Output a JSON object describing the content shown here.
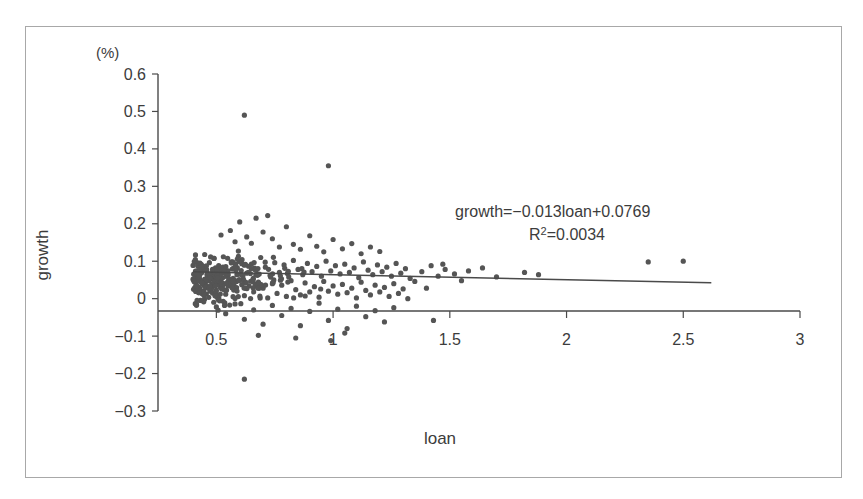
{
  "chart_data": {
    "type": "scatter",
    "title": "",
    "xlabel": "loan",
    "ylabel": "growth",
    "unit_label": "(%)",
    "xlim": [
      0.25,
      3.0
    ],
    "ylim": [
      -0.3,
      0.6
    ],
    "grid": false,
    "legend": "none",
    "x_ticks": [
      "0.5",
      "1",
      "1.5",
      "2",
      "2.5",
      "3"
    ],
    "x_tick_values": [
      0.5,
      1,
      1.5,
      2,
      2.5,
      3
    ],
    "y_ticks": [
      "0.6",
      "0.5",
      "0.4",
      "0.3",
      "0.2",
      "0.1",
      "0",
      "−0.1",
      "−0.2",
      "−0.3"
    ],
    "y_tick_values": [
      0.6,
      0.5,
      0.4,
      0.3,
      0.2,
      0.1,
      0,
      -0.1,
      -0.2,
      -0.3
    ],
    "annotations": [
      {
        "id": "regression-equation",
        "text": "growth=−0.013loan+0.0769"
      },
      {
        "id": "r-squared",
        "text_prefix": "R",
        "text_sup": "2",
        "text_suffix": "=0.0034",
        "text": "R²=0.0034"
      }
    ],
    "trendline": {
      "slope": -0.013,
      "intercept": 0.0769,
      "x_start": 0.4,
      "x_end": 2.62,
      "r_squared": 0.0034
    },
    "marker": {
      "shape": "circle",
      "radius": 2.6,
      "color": "#555555"
    },
    "n_points": 430,
    "points": [
      [
        0.62,
        0.49
      ],
      [
        0.98,
        0.355
      ],
      [
        0.6,
        0.205
      ],
      [
        0.67,
        0.215
      ],
      [
        0.72,
        0.222
      ],
      [
        0.52,
        0.17
      ],
      [
        0.56,
        0.182
      ],
      [
        0.58,
        0.152
      ],
      [
        0.63,
        0.165
      ],
      [
        0.65,
        0.148
      ],
      [
        0.7,
        0.178
      ],
      [
        0.74,
        0.16
      ],
      [
        0.77,
        0.138
      ],
      [
        0.8,
        0.192
      ],
      [
        0.83,
        0.145
      ],
      [
        0.86,
        0.132
      ],
      [
        0.9,
        0.168
      ],
      [
        0.93,
        0.14
      ],
      [
        0.96,
        0.125
      ],
      [
        1.0,
        0.158
      ],
      [
        1.04,
        0.133
      ],
      [
        1.08,
        0.147
      ],
      [
        1.12,
        0.12
      ],
      [
        1.16,
        0.138
      ],
      [
        1.2,
        0.126
      ],
      [
        0.45,
        0.118
      ],
      [
        0.47,
        0.096
      ],
      [
        0.49,
        0.108
      ],
      [
        0.51,
        0.088
      ],
      [
        0.53,
        0.112
      ],
      [
        0.55,
        0.074
      ],
      [
        0.57,
        0.098
      ],
      [
        0.59,
        0.082
      ],
      [
        0.61,
        0.104
      ],
      [
        0.63,
        0.068
      ],
      [
        0.65,
        0.092
      ],
      [
        0.67,
        0.076
      ],
      [
        0.69,
        0.11
      ],
      [
        0.71,
        0.084
      ],
      [
        0.73,
        0.062
      ],
      [
        0.75,
        0.096
      ],
      [
        0.77,
        0.07
      ],
      [
        0.79,
        0.09
      ],
      [
        0.81,
        0.058
      ],
      [
        0.83,
        0.102
      ],
      [
        0.85,
        0.078
      ],
      [
        0.87,
        0.064
      ],
      [
        0.89,
        0.094
      ],
      [
        0.91,
        0.072
      ],
      [
        0.93,
        0.086
      ],
      [
        0.95,
        0.06
      ],
      [
        0.97,
        0.1
      ],
      [
        0.99,
        0.074
      ],
      [
        1.01,
        0.088
      ],
      [
        1.03,
        0.066
      ],
      [
        1.05,
        0.092
      ],
      [
        1.07,
        0.07
      ],
      [
        1.09,
        0.082
      ],
      [
        1.11,
        0.056
      ],
      [
        1.13,
        0.098
      ],
      [
        1.15,
        0.076
      ],
      [
        1.17,
        0.064
      ],
      [
        1.19,
        0.09
      ],
      [
        1.21,
        0.072
      ],
      [
        1.23,
        0.084
      ],
      [
        1.25,
        0.06
      ],
      [
        1.27,
        0.094
      ],
      [
        1.29,
        0.068
      ],
      [
        1.31,
        0.08
      ],
      [
        1.33,
        0.054
      ],
      [
        0.44,
        0.042
      ],
      [
        0.46,
        0.03
      ],
      [
        0.48,
        0.054
      ],
      [
        0.5,
        0.022
      ],
      [
        0.52,
        0.046
      ],
      [
        0.54,
        0.012
      ],
      [
        0.56,
        0.038
      ],
      [
        0.58,
        0.026
      ],
      [
        0.6,
        0.05
      ],
      [
        0.62,
        0.008
      ],
      [
        0.64,
        0.034
      ],
      [
        0.66,
        0.018
      ],
      [
        0.68,
        0.044
      ],
      [
        0.7,
        0.028
      ],
      [
        0.72,
        0.002
      ],
      [
        0.74,
        0.04
      ],
      [
        0.76,
        0.014
      ],
      [
        0.78,
        0.036
      ],
      [
        0.8,
        0.006
      ],
      [
        0.82,
        0.048
      ],
      [
        0.84,
        0.024
      ],
      [
        0.86,
        0.01
      ],
      [
        0.88,
        0.042
      ],
      [
        0.9,
        0.018
      ],
      [
        0.92,
        0.032
      ],
      [
        0.94,
        0.004
      ],
      [
        0.96,
        0.046
      ],
      [
        0.98,
        0.02
      ],
      [
        1.0,
        0.034
      ],
      [
        1.02,
        0.012
      ],
      [
        1.04,
        0.038
      ],
      [
        1.06,
        0.016
      ],
      [
        1.08,
        0.028
      ],
      [
        1.1,
        0.002
      ],
      [
        1.12,
        0.044
      ],
      [
        1.14,
        0.022
      ],
      [
        1.16,
        0.01
      ],
      [
        1.18,
        0.036
      ],
      [
        1.2,
        0.018
      ],
      [
        1.22,
        0.03
      ],
      [
        1.24,
        0.006
      ],
      [
        1.26,
        0.04
      ],
      [
        1.28,
        0.014
      ],
      [
        1.3,
        0.026
      ],
      [
        1.32,
        0.0
      ],
      [
        0.5,
        -0.022
      ],
      [
        0.54,
        -0.04
      ],
      [
        0.58,
        -0.014
      ],
      [
        0.62,
        -0.055
      ],
      [
        0.66,
        -0.03
      ],
      [
        0.7,
        -0.068
      ],
      [
        0.74,
        -0.018
      ],
      [
        0.78,
        -0.045
      ],
      [
        0.82,
        -0.026
      ],
      [
        0.86,
        -0.072
      ],
      [
        0.9,
        -0.034
      ],
      [
        0.94,
        -0.012
      ],
      [
        0.98,
        -0.058
      ],
      [
        1.02,
        -0.028
      ],
      [
        1.06,
        -0.08
      ],
      [
        1.1,
        -0.02
      ],
      [
        1.14,
        -0.048
      ],
      [
        1.18,
        -0.032
      ],
      [
        1.22,
        -0.062
      ],
      [
        1.26,
        -0.024
      ],
      [
        0.62,
        -0.215
      ],
      [
        0.68,
        -0.098
      ],
      [
        0.84,
        -0.105
      ],
      [
        0.99,
        -0.112
      ],
      [
        1.05,
        -0.092
      ],
      [
        1.38,
        0.072
      ],
      [
        1.42,
        0.088
      ],
      [
        1.45,
        0.06
      ],
      [
        1.48,
        0.078
      ],
      [
        1.52,
        0.066
      ],
      [
        1.58,
        0.074
      ],
      [
        1.64,
        0.082
      ],
      [
        1.7,
        0.058
      ],
      [
        1.82,
        0.07
      ],
      [
        1.88,
        0.064
      ],
      [
        2.35,
        0.098
      ],
      [
        2.5,
        0.1
      ],
      [
        0.42,
        0.088
      ],
      [
        0.43,
        0.066
      ],
      [
        0.41,
        0.104
      ],
      [
        0.4,
        0.052
      ],
      [
        1.35,
        0.046
      ],
      [
        1.4,
        0.028
      ],
      [
        1.43,
        -0.058
      ],
      [
        1.47,
        0.092
      ],
      [
        1.55,
        0.048
      ]
    ]
  },
  "figure": {
    "border_color": "#a8a8a8",
    "background": "#ffffff",
    "axis_color": "#4a4a4a",
    "point_color": "#555555"
  }
}
